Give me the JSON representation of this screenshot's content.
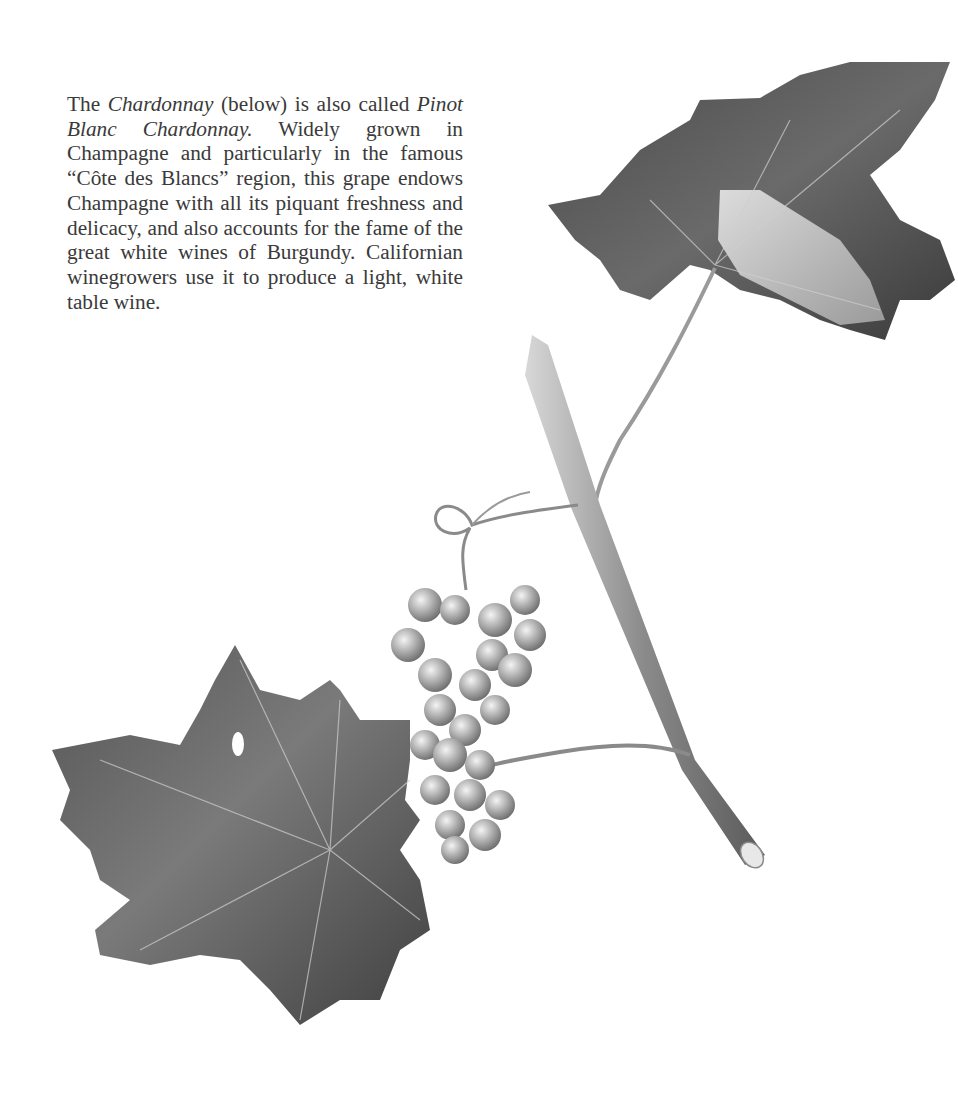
{
  "caption": {
    "part1": "The ",
    "italic1": "Chardonnay",
    "part2": " (below) is also called ",
    "italic2": "Pinot Blanc Chardonnay.",
    "part3": "  Widely grown in Champagne and particularly in the famous “Côte des Blancs” region, this grape endows Champagne with all its piquant freshness and delicacy, and also accounts for the fame of the great white wines of Bur­gundy.  Californian winegrowers use it to produce a light, white table wine."
  },
  "illustration": {
    "subject": "Chardonnay grape vine branch with leaves, tendril and grape cluster",
    "style": "monochrome botanical drawing"
  },
  "colors": {
    "text": "#3a3a3a",
    "background": "#ffffff",
    "leaf_dark": "#3c3c3c",
    "leaf_mid": "#6e6e6e",
    "leaf_light": "#b4b4b4"
  }
}
